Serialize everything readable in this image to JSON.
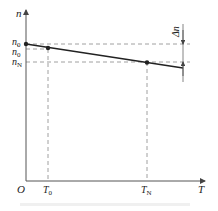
{
  "diagram": {
    "type": "speed-torque characteristic",
    "axes": {
      "y_label": "n",
      "x_label": "T",
      "origin_label": "O"
    },
    "y_marks": [
      {
        "id": "n0",
        "base": "n",
        "sub": "0",
        "prime": ""
      },
      {
        "id": "n0_prime",
        "base": "n",
        "sub": "0",
        "prime": "′"
      },
      {
        "id": "nN",
        "base": "n",
        "sub": "N",
        "prime": ""
      }
    ],
    "x_marks": [
      {
        "id": "T0",
        "base": "T",
        "sub": "0"
      },
      {
        "id": "TN",
        "base": "T",
        "sub": "N"
      }
    ],
    "delta_label": "Δn",
    "line": {
      "description": "linear drooping characteristic from n0 at T=0 through (T0, n0′) and (TN, nN)",
      "points": [
        {
          "T": "0",
          "n": "n0"
        },
        {
          "T": "T0",
          "n": "n0′"
        },
        {
          "T": "TN",
          "n": "nN"
        }
      ]
    },
    "colors": {
      "line": "#222222",
      "dashed": "#777777",
      "axis": "#555555"
    }
  }
}
